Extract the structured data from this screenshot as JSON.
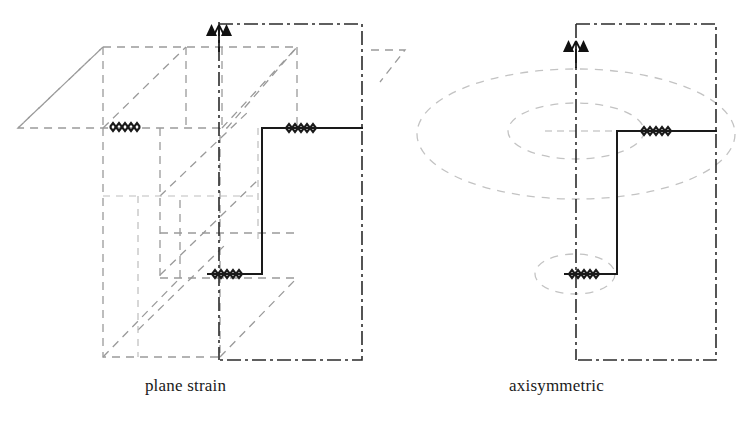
{
  "figure": {
    "background_color": "#ffffff",
    "width": 742,
    "height": 424
  },
  "colors": {
    "solid_line": "#1a1a1a",
    "hidden_line": "#8f8f8f",
    "light_hidden_line": "#b9b9b9",
    "axis_line": "#2b2b2b",
    "marker_fill": "#111111",
    "caption_text": "#1a1a1a"
  },
  "panels": [
    {
      "id": "plane-strain",
      "caption": "plane strain",
      "symmetry_marker": "symmetry-axis-arrow",
      "axis_style": "dash-dot",
      "geometry_style": "3d-oblique-projection",
      "solid_profile": "stepped-L-section",
      "hidden_geometry": "extruded-prism-outline"
    },
    {
      "id": "axisymmetric",
      "caption": "axisymmetric",
      "symmetry_marker": "symmetry-axis-arrow",
      "axis_style": "dash-dot",
      "geometry_style": "revolved-solid",
      "solid_profile": "stepped-L-section",
      "hidden_geometry": "revolution-ellipses"
    }
  ],
  "annotations": {
    "hatch_marks": [
      {
        "panel": "plane-strain",
        "location": "upper-left-flange",
        "symbol": "zigzag-hatch"
      },
      {
        "panel": "plane-strain",
        "location": "upper-right-flange",
        "symbol": "zigzag-hatch"
      },
      {
        "panel": "plane-strain",
        "location": "lower-step-base",
        "symbol": "zigzag-hatch"
      },
      {
        "panel": "axisymmetric",
        "location": "upper-right-flange",
        "symbol": "zigzag-hatch"
      },
      {
        "panel": "axisymmetric",
        "location": "lower-step-base",
        "symbol": "zigzag-hatch"
      }
    ]
  },
  "captions": {
    "left": "plane strain",
    "right": "axisymmetric"
  }
}
